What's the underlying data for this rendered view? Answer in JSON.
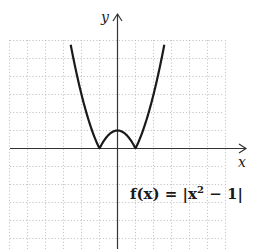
{
  "chart_data": {
    "type": "line",
    "title": "",
    "function_label": "f(x) = |x² − 1|",
    "xlabel": "x",
    "ylabel": "y",
    "xlim": [
      -6,
      6
    ],
    "ylim": [
      -6,
      6
    ],
    "grid": true,
    "grid_style": "dotted",
    "ticks_labeled": false,
    "series": [
      {
        "name": "f(x) = |x² − 1|",
        "x": [
          -2.6,
          -2,
          -1.5,
          -1,
          -0.5,
          0,
          0.5,
          1,
          1.5,
          2,
          2.6
        ],
        "y": [
          5.76,
          3,
          1.25,
          0,
          0.75,
          1,
          0.75,
          0,
          1.25,
          3,
          5.76
        ]
      }
    ],
    "key_points": {
      "zeros": [
        [
          -1,
          0
        ],
        [
          1,
          0
        ]
      ],
      "local_max": [
        0,
        1
      ]
    }
  },
  "labels": {
    "x_axis": "x",
    "y_axis": "y",
    "function": {
      "name": "f(x) = |x",
      "exp": "2",
      "rest": " − 1|"
    }
  },
  "colors": {
    "curve": "#1a1a1a",
    "axis": "#333333",
    "grid": "#b0b0b0",
    "background": "#ffffff"
  }
}
